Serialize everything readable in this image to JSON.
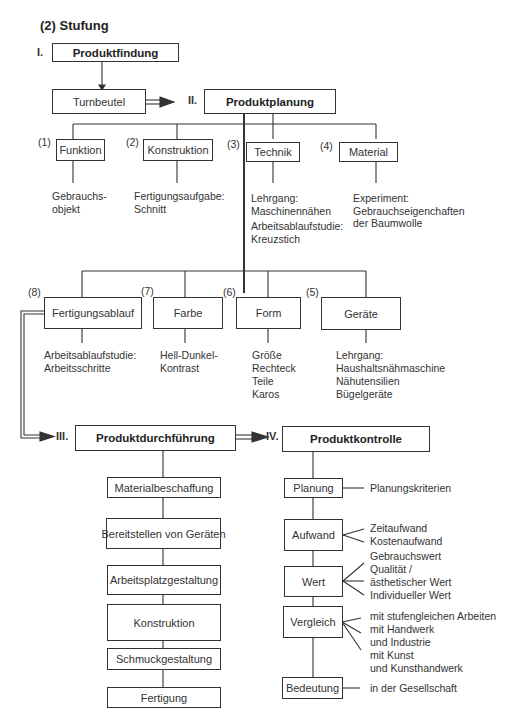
{
  "title": "(2) Stufung",
  "stages": {
    "I": {
      "roman": "I.",
      "label": "Produktfindung"
    },
    "II": {
      "roman": "II.",
      "label": "Produktplanung"
    },
    "III": {
      "roman": "III.",
      "label": "Produktdurchführung"
    },
    "IV": {
      "roman": "IV.",
      "label": "Produktkontrolle"
    }
  },
  "product": "Turnbeutel",
  "planning_top": [
    {
      "num": "(1)",
      "label": "Funktion",
      "notes": [
        "Gebrauchs-",
        "objekt"
      ]
    },
    {
      "num": "(2)",
      "label": "Konstruktion",
      "notes": [
        "Fertigungsaufgabe:",
        "Schnitt"
      ]
    },
    {
      "num": "(3)",
      "label": "Technik",
      "notes": [
        "Lehrgang:",
        "Maschinennähen",
        "Arbeitsablaufstudie:",
        "Kreuzstich"
      ]
    },
    {
      "num": "(4)",
      "label": "Material",
      "notes": [
        "Experiment:",
        "Gebrauchseigenchaften",
        "der Baumwolle"
      ]
    }
  ],
  "planning_bottom": [
    {
      "num": "(8)",
      "label": "Fertigungsablauf",
      "notes": [
        "Arbeitsablaufstudie:",
        "Arbeitsschritte"
      ]
    },
    {
      "num": "(7)",
      "label": "Farbe",
      "notes": [
        "Hell-Dunkel-",
        "Kontrast"
      ]
    },
    {
      "num": "(6)",
      "label": "Form",
      "notes": [
        "Größe",
        "Rechteck",
        "Teile",
        "Karos"
      ]
    },
    {
      "num": "(5)",
      "label": "Geräte",
      "notes": [
        "Lehrgang:",
        "Haushaltsnähmaschine",
        "Nähutensilien",
        "Bügelgeräte"
      ]
    }
  ],
  "execution_steps": [
    "Materialbeschaffung",
    "Bereitstellen von Geräten",
    "Arbeitsplatzgestaltung",
    "Konstruktion",
    "Schmuckgestaltung",
    "Fertigung"
  ],
  "control_steps": [
    {
      "label": "Planung",
      "notes": [
        "Planungskriterien"
      ]
    },
    {
      "label": "Aufwand",
      "notes": [
        "Zeitaufwand",
        "Kostenaufwand"
      ]
    },
    {
      "label": "Wert",
      "notes": [
        "Gebrauchswert",
        "Qualität /",
        "ästhetischer Wert",
        "Individueller Wert"
      ]
    },
    {
      "label": "Vergleich",
      "notes": [
        "mit stufengleichen Arbeiten",
        "mit Handwerk",
        "und Industrie",
        "mit Kunst",
        "und Kunsthandwerk"
      ]
    },
    {
      "label": "Bedeutung",
      "notes": [
        "in der Gesellschaft"
      ]
    }
  ]
}
